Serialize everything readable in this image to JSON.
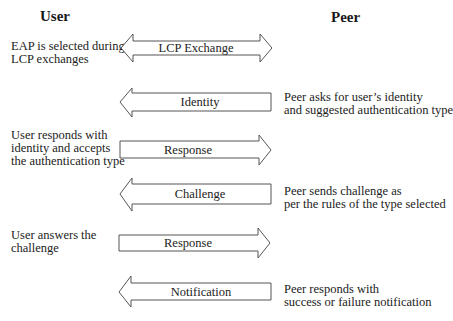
{
  "diagram": {
    "columns": {
      "left_title": "User",
      "right_title": "Peer"
    },
    "steps": [
      {
        "message": "LCP Exchange",
        "direction": "both",
        "user_note": [
          "EAP is selected during",
          "LCP exchanges"
        ],
        "peer_note": []
      },
      {
        "message": "Identity",
        "direction": "peer-to-user",
        "user_note": [],
        "peer_note": [
          "Peer asks for user's identity",
          "and suggested authentication type"
        ]
      },
      {
        "message": "Response",
        "direction": "user-to-peer",
        "user_note": [
          "User responds with",
          "identity and accepts",
          "the authentication type"
        ],
        "peer_note": []
      },
      {
        "message": "Challenge",
        "direction": "peer-to-user",
        "user_note": [],
        "peer_note": [
          "Peer sends challenge as",
          "per the rules of the type selected"
        ]
      },
      {
        "message": "Response",
        "direction": "user-to-peer",
        "user_note": [
          "User answers the",
          "challenge"
        ],
        "peer_note": []
      },
      {
        "message": "Notification",
        "direction": "peer-to-user",
        "user_note": [],
        "peer_note": [
          "Peer responds with",
          "success or failure notification"
        ]
      }
    ]
  },
  "labels": {
    "user_note_0": "EAP is selected during\nLCP exchanges",
    "peer_note_1": "Peer asks for user’s identity\nand suggested authentication type",
    "user_note_2": "User responds with\nidentity and accepts\nthe authentication type",
    "peer_note_3": "Peer sends challenge as\nper the rules of the type selected",
    "user_note_4": "User answers the\nchallenge",
    "peer_note_5": "Peer responds with\nsuccess or failure notification"
  }
}
